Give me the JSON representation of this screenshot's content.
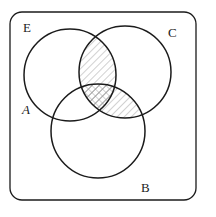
{
  "figure": {
    "type": "venn-diagram",
    "universe_label": "E",
    "background_color": "#ffffff",
    "stroke_color": "#1b1b1b",
    "hatch_color": "#9a9a9a",
    "frame": {
      "name": "universal-set-rectangle",
      "x": 10,
      "y": 12,
      "width": 186,
      "height": 188,
      "corner_radius": 12,
      "stroke_width": 1.3
    },
    "circles": [
      {
        "label": "A",
        "cx": 70,
        "cy": 75,
        "r": 46,
        "stroke_width": 1.5
      },
      {
        "label": "C",
        "cx": 125,
        "cy": 72,
        "r": 46,
        "stroke_width": 1.5
      },
      {
        "label": "B",
        "cx": 98,
        "cy": 131,
        "r": 47,
        "stroke_width": 1.5
      }
    ],
    "labels": [
      {
        "name": "label-universe-E",
        "text": "E",
        "style": "roman"
      },
      {
        "name": "label-set-C",
        "text": "C",
        "style": "roman"
      },
      {
        "name": "label-set-A",
        "text": "A",
        "style": "italic"
      },
      {
        "name": "label-set-B",
        "text": "B",
        "style": "roman"
      }
    ],
    "shaded_regions": [
      {
        "name": "region-A-and-C",
        "description": "intersection of A and C",
        "fill": "diagonal-hatch",
        "hatch_angle_deg": 45,
        "hatch_spacing_px": 5
      },
      {
        "name": "region-C-and-B",
        "description": "intersection of C and B",
        "fill": "diagonal-hatch",
        "hatch_angle_deg": 45,
        "hatch_spacing_px": 5
      },
      {
        "name": "region-A-and-B-and-C",
        "description": "intersection of A, B and C",
        "fill": "cross-hatch",
        "hatch_angle_deg": 45,
        "hatch_spacing_px": 5
      }
    ]
  }
}
